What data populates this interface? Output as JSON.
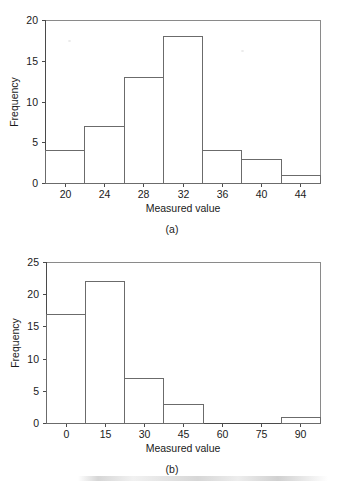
{
  "figure": {
    "background_color": "#ffffff",
    "line_color": "#6b6b6b",
    "text_color": "#1a1a1a"
  },
  "chart_data": [
    {
      "type": "bar",
      "panel": "(a)",
      "title": "",
      "xlabel": "Measured value",
      "ylabel": "Frequency",
      "xlim": [
        18,
        46
      ],
      "ylim": [
        0,
        20
      ],
      "xticks": [
        20,
        24,
        28,
        32,
        36,
        40,
        44
      ],
      "xtick_labels": [
        "20",
        "24",
        "28",
        "32",
        "36",
        "40",
        "44"
      ],
      "yticks": [
        0,
        5,
        10,
        15,
        20
      ],
      "ytick_labels": [
        "0",
        "5",
        "10",
        "15",
        "20"
      ],
      "grid": false,
      "legend": null,
      "bin_width": 4,
      "bin_edges": [
        18,
        22,
        26,
        30,
        34,
        38,
        42,
        46
      ],
      "bin_centers": [
        20,
        24,
        28,
        32,
        36,
        40,
        44
      ],
      "values": [
        4,
        7,
        13,
        18,
        4,
        3,
        1
      ]
    },
    {
      "type": "bar",
      "panel": "(b)",
      "title": "",
      "xlabel": "Measured value",
      "ylabel": "Frequency",
      "xlim": [
        -7.5,
        97.5
      ],
      "ylim": [
        0,
        25
      ],
      "xticks": [
        0,
        15,
        30,
        45,
        60,
        75,
        90
      ],
      "xtick_labels": [
        "0",
        "15",
        "30",
        "45",
        "60",
        "75",
        "90"
      ],
      "yticks": [
        0,
        5,
        10,
        15,
        20,
        25
      ],
      "ytick_labels": [
        "0",
        "5",
        "10",
        "15",
        "20",
        "25"
      ],
      "grid": false,
      "legend": null,
      "bin_width": 15,
      "bin_edges": [
        -7.5,
        7.5,
        22.5,
        37.5,
        52.5,
        67.5,
        82.5,
        97.5
      ],
      "bin_centers": [
        0,
        15,
        30,
        45,
        60,
        75,
        90
      ],
      "values": [
        17,
        22,
        7,
        3,
        0,
        0,
        1
      ]
    }
  ],
  "panel_a": {
    "caption": "(a)",
    "xlabel": "Measured value",
    "ylabel": "Frequency",
    "ytick_labels": [
      "0",
      "5",
      "10",
      "15",
      "20"
    ],
    "xtick_labels": [
      "20",
      "24",
      "28",
      "32",
      "36",
      "40",
      "44"
    ]
  },
  "panel_b": {
    "caption": "(b)",
    "xlabel": "Measured value",
    "ylabel": "Frequency",
    "ytick_labels": [
      "0",
      "5",
      "10",
      "15",
      "20",
      "25"
    ],
    "xtick_labels": [
      "0",
      "15",
      "30",
      "45",
      "60",
      "75",
      "90"
    ]
  }
}
